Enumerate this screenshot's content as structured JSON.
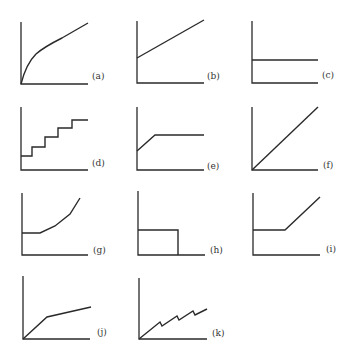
{
  "figure": {
    "colors": {
      "ink": "#2a2a2a",
      "label": "#333333",
      "background": "#ffffff"
    },
    "panels": [
      {
        "id": "a",
        "label": "(a)",
        "shape": "concave increasing curve from origin",
        "axes": {
          "x0": 21,
          "y0": 84,
          "xmax": 88,
          "ytop": 22
        },
        "path": "M21,84 C24,72 28,62 36,54 C44,47 52,43 62,38 L88,23",
        "label_pos": [
          92,
          79
        ]
      },
      {
        "id": "b",
        "label": "(b)",
        "shape": "linear increasing with positive intercept",
        "axes": {
          "x0": 137,
          "y0": 83,
          "xmax": 204,
          "ytop": 21
        },
        "path": "M137,58 L204,20",
        "label_pos": [
          207,
          79
        ]
      },
      {
        "id": "c",
        "label": "(c)",
        "shape": "constant horizontal line",
        "axes": {
          "x0": 252,
          "y0": 83,
          "xmax": 318,
          "ytop": 21
        },
        "path": "M252,60 L318,60",
        "label_pos": [
          322,
          78
        ]
      },
      {
        "id": "d",
        "label": "(d)",
        "shape": "staircase step function",
        "axes": {
          "x0": 21,
          "y0": 170,
          "xmax": 88,
          "ytop": 107
        },
        "path": "M21,156 L32,156 L32,147 L45,147 L45,137 L58,137 L58,128 L72,128 L72,120 L88,120",
        "label_pos": [
          92,
          166
        ]
      },
      {
        "id": "e",
        "label": "(e)",
        "shape": "linear rise then constant plateau",
        "axes": {
          "x0": 137,
          "y0": 170,
          "xmax": 204,
          "ytop": 107
        },
        "path": "M137,151 L155,135 L204,135",
        "label_pos": [
          207,
          169
        ]
      },
      {
        "id": "f",
        "label": "(f)",
        "shape": "linear through origin",
        "axes": {
          "x0": 252,
          "y0": 170,
          "xmax": 318,
          "ytop": 107
        },
        "path": "M252,170 L318,107",
        "label_pos": [
          323,
          168
        ]
      },
      {
        "id": "g",
        "label": "(g)",
        "shape": "constant then convex increasing",
        "axes": {
          "x0": 22,
          "y0": 255,
          "xmax": 88,
          "ytop": 193
        },
        "path": "M22,233 L40,233 L55,226 L70,214 L80,198",
        "label_pos": [
          93,
          253
        ]
      },
      {
        "id": "h",
        "label": "(h)",
        "shape": "constant then drops to zero (rectangular)",
        "axes": {
          "x0": 138,
          "y0": 255,
          "xmax": 205,
          "ytop": 191
        },
        "path": "M138,230 L178,230 L178,255",
        "label_pos": [
          210,
          253
        ]
      },
      {
        "id": "i",
        "label": "(i)",
        "shape": "constant then linear increase",
        "axes": {
          "x0": 253,
          "y0": 255,
          "xmax": 320,
          "ytop": 193
        },
        "path": "M253,230 L285,230 L320,197",
        "label_pos": [
          326,
          252
        ]
      },
      {
        "id": "j",
        "label": "(j)",
        "shape": "steep linear then shallower linear from origin",
        "axes": {
          "x0": 23,
          "y0": 339,
          "xmax": 90,
          "ytop": 276
        },
        "path": "M23,339 L47,317 L91,307",
        "label_pos": [
          97,
          335
        ]
      },
      {
        "id": "k",
        "label": "(k)",
        "shape": "sawtooth increasing from origin",
        "axes": {
          "x0": 139,
          "y0": 339,
          "xmax": 207,
          "ytop": 278
        },
        "path": "M139,339 L160,322 L162,326 L177,316 L179,320 L193,311 L195,315 L207,309",
        "label_pos": [
          212,
          336
        ]
      }
    ]
  }
}
